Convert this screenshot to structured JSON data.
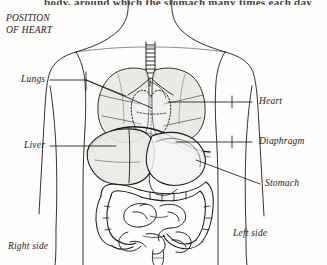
{
  "page": {
    "cut_off_header": "body, around which the stomach many times each day",
    "background_color": "#fdfdfb",
    "ink_color": "#1d1b19"
  },
  "title": {
    "line1": "POSITION",
    "line2": "OF HEART"
  },
  "labels": {
    "lungs": "Lungs",
    "liver": "Liver",
    "heart": "Heart",
    "diaphragm": "Diaphragm",
    "stomach": "Stomach",
    "right_side": "Right side",
    "left_side": "Left side"
  },
  "diagram": {
    "type": "anatomical-line-drawing",
    "view": "anterior",
    "organs": [
      "trachea",
      "bronchi",
      "right lung",
      "left lung",
      "heart",
      "diaphragm",
      "liver",
      "stomach",
      "large intestine",
      "small intestine",
      "rectum"
    ],
    "shading": {
      "lung_fill": "#e8e6e3",
      "liver_fill": "#ebe9e6",
      "stomach_fill": "#f4f3f1"
    }
  }
}
